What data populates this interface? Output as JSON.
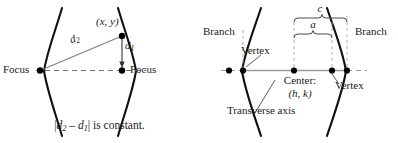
{
  "figure": {
    "stroke_color": "#111111",
    "dash_color": "#7a7a7a",
    "guide_color": "#9a9a9a",
    "axis_color": "#8a8a8a"
  },
  "left_panel": {
    "name": "hyperbola-focal-definition",
    "focus_left_label": "Focus",
    "focus_right_label": "Focus",
    "point_label": "(x, y)",
    "distance_far_label": "d",
    "distance_far_sub": "2",
    "distance_near_label": "d",
    "distance_near_sub": "1",
    "caption_prefix": "|",
    "caption_d2": "d",
    "caption_d2_sub": "2",
    "caption_minus": " – ",
    "caption_d1": "d",
    "caption_d1_sub": "1",
    "caption_suffix": "|  is  constant."
  },
  "right_panel": {
    "name": "hyperbola-parts",
    "branch_left_label": "Branch",
    "branch_right_label": "Branch",
    "vertex_left_label": "Vertex",
    "vertex_right_label": "Vertex",
    "center_label": "Center:",
    "center_coords": "(h, k)",
    "transverse_axis_label": "Transverse axis",
    "brace_c_label": "c",
    "brace_a_label": "a"
  }
}
